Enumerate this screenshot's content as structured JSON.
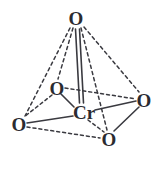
{
  "figure": {
    "formula": "CrO4",
    "background_color": "#ffffff",
    "bond_color": "#3a3a40",
    "label_color": "#2b2b30"
  },
  "atoms": [
    {
      "id": "o-top",
      "label": "O",
      "element": "O",
      "x": 76,
      "y": 18,
      "role": "apical-oxygen"
    },
    {
      "id": "o-left",
      "label": "O",
      "element": "O",
      "x": 57,
      "y": 88,
      "role": "basal-oxygen"
    },
    {
      "id": "o-far-left",
      "label": "O",
      "element": "O",
      "x": 19,
      "y": 124,
      "role": "basal-oxygen"
    },
    {
      "id": "o-right",
      "label": "O",
      "element": "O",
      "x": 144,
      "y": 100,
      "role": "basal-oxygen"
    },
    {
      "id": "o-bottom",
      "label": "O",
      "element": "O",
      "x": 109,
      "y": 139,
      "role": "basal-oxygen"
    },
    {
      "id": "cr-center",
      "label": "Cr",
      "element": "Cr",
      "x": 84,
      "y": 112,
      "role": "central-metal"
    }
  ],
  "bonds": [
    {
      "id": "bond-cr-otop",
      "from": "cr-center",
      "to": "o-top",
      "style": "double-solid"
    },
    {
      "id": "bond-cr-oleft",
      "from": "cr-center",
      "to": "o-left",
      "style": "solid"
    },
    {
      "id": "bond-cr-ofarleft",
      "from": "cr-center",
      "to": "o-far-left",
      "style": "solid"
    },
    {
      "id": "bond-cr-oright",
      "from": "cr-center",
      "to": "o-right",
      "style": "solid"
    },
    {
      "id": "bond-cr-obottom",
      "from": "cr-center",
      "to": "o-bottom",
      "style": "solid"
    },
    {
      "id": "edge-otop-ofarleft",
      "from": "o-top",
      "to": "o-far-left",
      "style": "dashed"
    },
    {
      "id": "edge-otop-oleft",
      "from": "o-top",
      "to": "o-left",
      "style": "dashed"
    },
    {
      "id": "edge-otop-obottom",
      "from": "o-top",
      "to": "o-bottom",
      "style": "dashed"
    },
    {
      "id": "edge-otop-oright",
      "from": "o-top",
      "to": "o-right",
      "style": "dashed"
    },
    {
      "id": "edge-oleft-ofarleft",
      "from": "o-left",
      "to": "o-far-left",
      "style": "dashed"
    },
    {
      "id": "edge-oleft-oright",
      "from": "o-left",
      "to": "o-right",
      "style": "dashed"
    },
    {
      "id": "edge-ofarleft-obottom",
      "from": "o-far-left",
      "to": "o-bottom",
      "style": "dashed"
    },
    {
      "id": "edge-obottom-oright",
      "from": "o-bottom",
      "to": "o-right",
      "style": "solid"
    }
  ]
}
